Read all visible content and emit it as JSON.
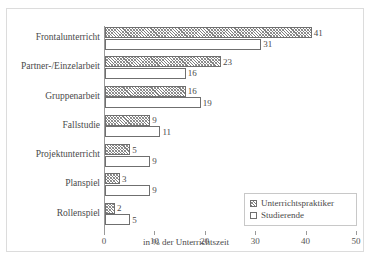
{
  "chart_data": {
    "type": "bar",
    "orientation": "horizontal",
    "title": "",
    "xlabel": "in % der Unterrichtszeit",
    "ylabel": "",
    "xlim": [
      0,
      50
    ],
    "xticks": [
      0,
      10,
      20,
      30,
      40,
      50
    ],
    "grid": false,
    "legend_position": "bottom-right",
    "categories": [
      "Frontalunterricht",
      "Partner-/Einzelarbeit",
      "Gruppenarbeit",
      "Fallstudie",
      "Projektunterricht",
      "Planspiel",
      "Rollenspiel"
    ],
    "series": [
      {
        "name": "Unterrichtspraktiker",
        "fill": "hatched",
        "values": [
          41,
          23,
          16,
          9,
          5,
          3,
          2
        ]
      },
      {
        "name": "Studierende",
        "fill": "white",
        "values": [
          31,
          16,
          19,
          11,
          9,
          9,
          5
        ]
      }
    ]
  },
  "axis": {
    "tick_labels": [
      "0",
      "10",
      "20",
      "30",
      "40",
      "50"
    ],
    "x_axis_title": "in % der Unterrichtszeit"
  },
  "legend": {
    "items": [
      {
        "label": "Unterrichtspraktiker",
        "swatch": "hatched-square-icon"
      },
      {
        "label": "Studierende",
        "swatch": "white-square-icon"
      }
    ]
  },
  "top_sliver_text": ""
}
